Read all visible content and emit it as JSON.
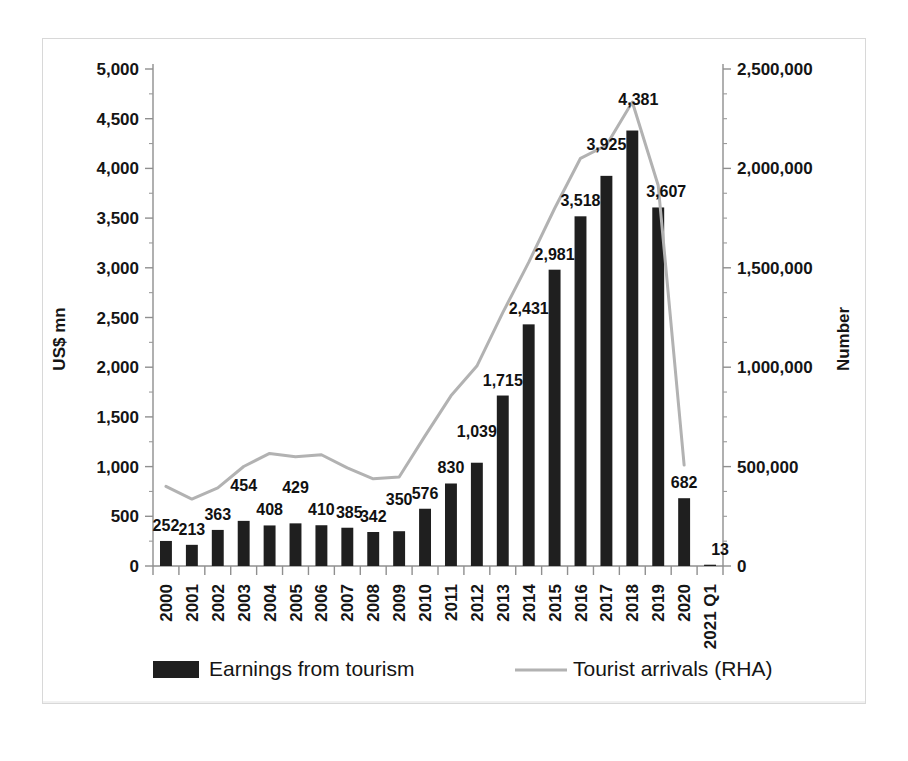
{
  "chart_data": {
    "type": "bar",
    "title": "",
    "subtitle": "",
    "xlabel": "",
    "ylabel": "US$ mn",
    "y2label": "Number",
    "ylim": [
      0,
      5000
    ],
    "y2lim": [
      0,
      2500000
    ],
    "ytick_labels": [
      "0",
      "500",
      "1,000",
      "1,500",
      "2,000",
      "2,500",
      "3,000",
      "3,500",
      "4,000",
      "4,500",
      "5,000"
    ],
    "ytick_values": [
      0,
      500,
      1000,
      1500,
      2000,
      2500,
      3000,
      3500,
      4000,
      4500,
      5000
    ],
    "y2tick_labels": [
      "0",
      "500,000",
      "1,000,000",
      "1,500,000",
      "2,000,000",
      "2,500,000"
    ],
    "y2tick_values": [
      0,
      500000,
      1000000,
      1500000,
      2000000,
      2500000
    ],
    "grid": false,
    "legend_position": "bottom",
    "categories": [
      "2000",
      "2001",
      "2002",
      "2003",
      "2004",
      "2005",
      "2006",
      "2007",
      "2008",
      "2009",
      "2010",
      "2011",
      "2012",
      "2013",
      "2014",
      "2015",
      "2016",
      "2017",
      "2018",
      "2019",
      "2020",
      "2021 Q1"
    ],
    "series": [
      {
        "name": "Earnings from tourism",
        "type": "bar",
        "axis": "left",
        "color": "#1f1f1f",
        "values": [
          252,
          213,
          363,
          454,
          408,
          429,
          410,
          385,
          342,
          350,
          576,
          830,
          1039,
          1715,
          2431,
          2981,
          3518,
          3925,
          4381,
          3607,
          682,
          13
        ],
        "labels": [
          "252",
          "213",
          "363",
          "454",
          "408",
          "429",
          "410",
          "385",
          "342",
          "350",
          "576",
          "830",
          "1,039",
          "1,715",
          "2,431",
          "2,981",
          "3,518",
          "3,925",
          "4,381",
          "3,607",
          "682",
          "13"
        ]
      },
      {
        "name": "Tourist arrivals (RHA)",
        "type": "line",
        "axis": "right",
        "color": "#b2b2b2",
        "values": [
          400414,
          336794,
          393171,
          500642,
          566202,
          549308,
          559603,
          494008,
          438475,
          447890,
          654476,
          855975,
          1005605,
          1274593,
          1527153,
          1798380,
          2050832,
          2116407,
          2333796,
          1913702,
          507704,
          null
        ]
      }
    ]
  },
  "legend": {
    "items": [
      {
        "label": "Earnings from tourism",
        "marker": "bar-swatch"
      },
      {
        "label": "Tourist arrivals (RHA)",
        "marker": "line-swatch"
      }
    ]
  }
}
